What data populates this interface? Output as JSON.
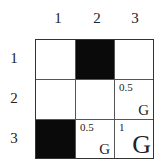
{
  "columns": [
    "1",
    "2",
    "3"
  ],
  "rows": [
    "1",
    "2",
    "3"
  ],
  "cells": [
    [
      {
        "fill": "white",
        "value": "",
        "goal": ""
      },
      {
        "fill": "black",
        "value": "",
        "goal": ""
      },
      {
        "fill": "white",
        "value": "",
        "goal": ""
      }
    ],
    [
      {
        "fill": "white",
        "value": "",
        "goal": ""
      },
      {
        "fill": "white",
        "value": "",
        "goal": ""
      },
      {
        "fill": "white",
        "value": "0.5",
        "goal": "G"
      }
    ],
    [
      {
        "fill": "black",
        "value": "",
        "goal": ""
      },
      {
        "fill": "white",
        "value": "0.5",
        "goal": "G"
      },
      {
        "fill": "white",
        "value": "1",
        "goal": "G",
        "goal_size": "large"
      }
    ]
  ],
  "colors": {
    "blocked": "#0a0a0a",
    "open": "#ffffff",
    "grid_line": "#333333"
  }
}
